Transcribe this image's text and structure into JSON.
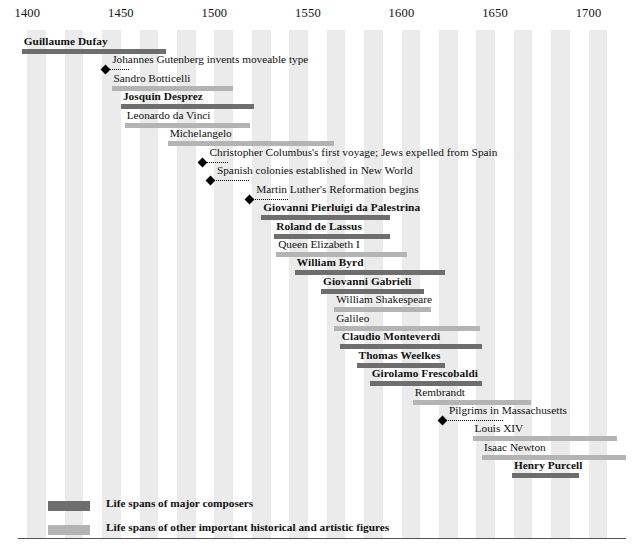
{
  "chart_data": {
    "type": "timeline",
    "title": "",
    "xlabel": "",
    "ylabel": "",
    "xlim": [
      1395,
      1720
    ],
    "ticks": [
      1400,
      1450,
      1500,
      1550,
      1600,
      1650,
      1700
    ],
    "tick_labels": [
      "1400",
      "1450",
      "1500",
      "1550",
      "1600",
      "1650",
      "1700"
    ],
    "grid": "alternating vertical bands every 10 years",
    "legend_position": "bottom-left",
    "rows": [
      {
        "label": "Guillaume Dufay",
        "kind": "composer",
        "start": 1397,
        "end": 1474
      },
      {
        "label": "Johannes Gutenberg invents moveable type",
        "kind": "event",
        "start": 1440,
        "end": 1455
      },
      {
        "label": "Sandro Botticelli",
        "kind": "figure",
        "start": 1445,
        "end": 1510
      },
      {
        "label": "Josquin Desprez",
        "kind": "composer",
        "start": 1450,
        "end": 1521
      },
      {
        "label": "Leonardo da Vinci",
        "kind": "figure",
        "start": 1452,
        "end": 1519
      },
      {
        "label": "Michelangelo",
        "kind": "figure",
        "start": 1475,
        "end": 1564
      },
      {
        "label": "Christopher Columbus's first voyage; Jews expelled from Spain",
        "kind": "event",
        "start": 1492,
        "end": 1508
      },
      {
        "label": "Spanish colonies established in New World",
        "kind": "event",
        "start": 1496,
        "end": 1519
      },
      {
        "label": "Martin Luther's Reformation begins",
        "kind": "event",
        "start": 1517,
        "end": 1540
      },
      {
        "label": "Giovanni Pierluigi da Palestrina",
        "kind": "composer",
        "start": 1525,
        "end": 1594
      },
      {
        "label": "Roland de Lassus",
        "kind": "composer",
        "start": 1532,
        "end": 1594
      },
      {
        "label": "Queen Elizabeth I",
        "kind": "figure",
        "start": 1533,
        "end": 1603
      },
      {
        "label": "William Byrd",
        "kind": "composer",
        "start": 1543,
        "end": 1623
      },
      {
        "label": "Giovanni Gabrieli",
        "kind": "composer",
        "start": 1557,
        "end": 1612
      },
      {
        "label": "William Shakespeare",
        "kind": "figure",
        "start": 1564,
        "end": 1616
      },
      {
        "label": "Galileo",
        "kind": "figure",
        "start": 1564,
        "end": 1642
      },
      {
        "label": "Claudio Monteverdi",
        "kind": "composer",
        "start": 1567,
        "end": 1643
      },
      {
        "label": "Thomas Weelkes",
        "kind": "composer",
        "start": 1576,
        "end": 1623
      },
      {
        "label": "Girolamo Frescobaldi",
        "kind": "composer",
        "start": 1583,
        "end": 1643
      },
      {
        "label": "Rembrandt",
        "kind": "figure",
        "start": 1606,
        "end": 1669
      },
      {
        "label": "Pilgrims in Massachusetts",
        "kind": "event",
        "start": 1620,
        "end": 1655
      },
      {
        "label": "Louis XIV",
        "kind": "figure",
        "start": 1638,
        "end": 1715
      },
      {
        "label": "Isaac Newton",
        "kind": "figure",
        "start": 1643,
        "end": 1727
      },
      {
        "label": "Henry Purcell",
        "kind": "composer",
        "start": 1659,
        "end": 1695
      }
    ],
    "legend": [
      {
        "swatch": "composer",
        "text": "Life spans of major composers"
      },
      {
        "swatch": "figure",
        "text": "Life spans of other important historical and artistic figures"
      },
      {
        "swatch": "event",
        "text": "Historical events"
      }
    ]
  },
  "colors": {
    "composer_bar": "#6e6e6e",
    "figure_bar": "#b4b4b4",
    "band": "#ebebeb",
    "background": "#ffffff",
    "text": "#111111",
    "rule": "#555555"
  }
}
